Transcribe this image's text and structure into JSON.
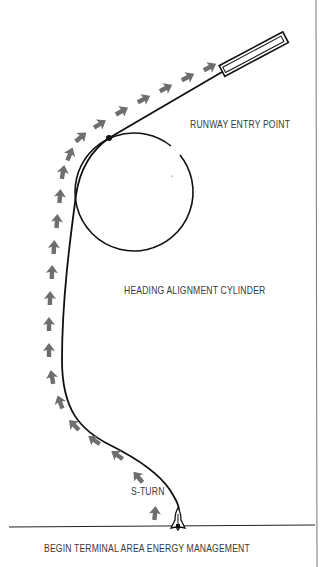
{
  "labels": {
    "runway_entry_point": "RUNWAY ENTRY POINT",
    "heading_alignment_cylinder": "HEADING ALIGNMENT CYLINDER",
    "s_turn": "S-TURN",
    "begin_tam": "BEGIN TERMINAL AREA ENERGY MANAGEMENT"
  },
  "colors": {
    "line": "#111111",
    "arrow": "#6e6e6e",
    "text": "#3a3a3a",
    "frame": "#777777"
  },
  "icons": {
    "shuttle": "space-shuttle-icon",
    "runway": "runway-icon",
    "direction_arrow": "arrow-icon"
  }
}
